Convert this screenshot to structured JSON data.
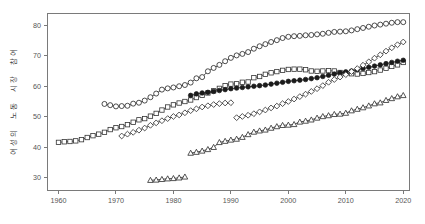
{
  "chart_data": {
    "type": "line",
    "title": "",
    "xlabel": "",
    "ylabel": "여성의 노동 시장 참여",
    "xlim": [
      1958,
      2021
    ],
    "ylim": [
      26,
      84
    ],
    "xticks": [
      1960,
      1970,
      1980,
      1990,
      2000,
      2010,
      2020
    ],
    "yticks": [
      30,
      40,
      50,
      60,
      70,
      80
    ],
    "grid": false,
    "legend": "none",
    "series": [
      {
        "name": "open-circle-series",
        "marker": "circle-open",
        "color": "#222222",
        "points": [
          [
            1968,
            54.2
          ],
          [
            1969,
            53.8
          ],
          [
            1970,
            53.4
          ],
          [
            1971,
            53.5
          ],
          [
            1972,
            53.6
          ],
          [
            1973,
            54.3
          ],
          [
            1974,
            54.6
          ],
          [
            1975,
            55.3
          ],
          [
            1976,
            56.4
          ],
          [
            1977,
            57.6
          ],
          [
            1978,
            58.9
          ],
          [
            1979,
            59.3
          ],
          [
            1980,
            59.6
          ],
          [
            1981,
            60.0
          ],
          [
            1982,
            60.4
          ],
          [
            1983,
            61.2
          ],
          [
            1984,
            62.6
          ],
          [
            1985,
            63.0
          ],
          [
            1986,
            64.9
          ],
          [
            1987,
            66.0
          ],
          [
            1988,
            67.0
          ],
          [
            1989,
            68.2
          ],
          [
            1990,
            69.3
          ],
          [
            1991,
            70.1
          ],
          [
            1992,
            70.6
          ],
          [
            1993,
            71.2
          ],
          [
            1994,
            72.3
          ],
          [
            1995,
            73.1
          ],
          [
            1996,
            73.8
          ],
          [
            1997,
            74.5
          ],
          [
            1998,
            75.1
          ],
          [
            1999,
            75.8
          ],
          [
            2000,
            76.2
          ],
          [
            2001,
            76.4
          ],
          [
            2002,
            76.5
          ],
          [
            2003,
            76.7
          ],
          [
            2004,
            76.8
          ],
          [
            2005,
            77.0
          ],
          [
            2006,
            77.2
          ],
          [
            2007,
            77.5
          ],
          [
            2008,
            77.8
          ],
          [
            2009,
            77.9
          ],
          [
            2010,
            78.0
          ],
          [
            2011,
            78.3
          ],
          [
            2012,
            78.7
          ],
          [
            2013,
            79.1
          ],
          [
            2014,
            79.5
          ],
          [
            2015,
            79.9
          ],
          [
            2016,
            80.2
          ],
          [
            2017,
            80.5
          ],
          [
            2018,
            80.8
          ],
          [
            2019,
            81.0
          ],
          [
            2020,
            81.0
          ]
        ]
      },
      {
        "name": "open-square-series",
        "marker": "square-open",
        "color": "#333333",
        "points": [
          [
            1960,
            41.6
          ],
          [
            1961,
            41.8
          ],
          [
            1962,
            41.9
          ],
          [
            1963,
            42.1
          ],
          [
            1964,
            42.5
          ],
          [
            1965,
            43.2
          ],
          [
            1966,
            43.8
          ],
          [
            1967,
            44.3
          ],
          [
            1968,
            44.9
          ],
          [
            1969,
            45.8
          ],
          [
            1970,
            46.4
          ],
          [
            1971,
            46.8
          ],
          [
            1972,
            47.4
          ],
          [
            1973,
            48.2
          ],
          [
            1974,
            49.0
          ],
          [
            1975,
            49.4
          ],
          [
            1976,
            50.2
          ],
          [
            1977,
            51.1
          ],
          [
            1978,
            52.2
          ],
          [
            1979,
            53.2
          ],
          [
            1980,
            53.9
          ],
          [
            1981,
            54.5
          ],
          [
            1982,
            55.0
          ],
          [
            1983,
            55.5
          ],
          [
            1984,
            56.3
          ],
          [
            1985,
            57.0
          ],
          [
            1986,
            57.8
          ],
          [
            1987,
            58.5
          ],
          [
            1988,
            59.3
          ],
          [
            1989,
            60.2
          ],
          [
            1990,
            60.7
          ],
          [
            1991,
            60.8
          ],
          [
            1992,
            61.3
          ],
          [
            1993,
            61.4
          ],
          [
            1994,
            62.8
          ],
          [
            1995,
            63.2
          ],
          [
            1996,
            63.9
          ],
          [
            1997,
            64.4
          ],
          [
            1998,
            64.8
          ],
          [
            1999,
            65.2
          ],
          [
            2000,
            65.5
          ],
          [
            2001,
            65.6
          ],
          [
            2002,
            65.6
          ],
          [
            2003,
            65.4
          ],
          [
            2004,
            65.0
          ],
          [
            2005,
            64.9
          ],
          [
            2006,
            65.0
          ],
          [
            2007,
            65.1
          ],
          [
            2008,
            65.0
          ],
          [
            2009,
            64.5
          ],
          [
            2010,
            64.2
          ],
          [
            2011,
            64.1
          ],
          [
            2012,
            64.0
          ],
          [
            2013,
            64.2
          ],
          [
            2014,
            64.5
          ],
          [
            2015,
            64.8
          ],
          [
            2016,
            65.3
          ],
          [
            2017,
            65.9
          ],
          [
            2018,
            66.5
          ],
          [
            2019,
            67.0
          ],
          [
            2020,
            67.8
          ]
        ]
      },
      {
        "name": "filled-circle-series",
        "marker": "circle-filled",
        "color": "#1b1b1b",
        "points": [
          [
            1983,
            57.0
          ],
          [
            1984,
            57.5
          ],
          [
            1985,
            57.8
          ],
          [
            1986,
            58.0
          ],
          [
            1987,
            58.3
          ],
          [
            1988,
            58.6
          ],
          [
            1989,
            58.9
          ],
          [
            1990,
            59.2
          ],
          [
            1991,
            59.4
          ],
          [
            1992,
            59.6
          ],
          [
            1993,
            59.8
          ],
          [
            1994,
            60.0
          ],
          [
            1995,
            60.2
          ],
          [
            1996,
            60.4
          ],
          [
            1997,
            60.7
          ],
          [
            1998,
            61.0
          ],
          [
            1999,
            61.3
          ],
          [
            2000,
            61.6
          ],
          [
            2001,
            61.8
          ],
          [
            2002,
            62.0
          ],
          [
            2003,
            62.2
          ],
          [
            2004,
            62.5
          ],
          [
            2005,
            62.8
          ],
          [
            2006,
            63.2
          ],
          [
            2007,
            63.6
          ],
          [
            2008,
            64.0
          ],
          [
            2009,
            64.4
          ],
          [
            2010,
            64.7
          ],
          [
            2011,
            65.0
          ],
          [
            2012,
            65.4
          ],
          [
            2013,
            65.8
          ],
          [
            2014,
            66.2
          ],
          [
            2015,
            66.6
          ],
          [
            2016,
            67.0
          ],
          [
            2017,
            67.4
          ],
          [
            2018,
            67.8
          ],
          [
            2019,
            68.2
          ],
          [
            2020,
            68.5
          ]
        ]
      },
      {
        "name": "open-diamond-series",
        "marker": "diamond-open",
        "color": "#2a2a2a",
        "points": [
          [
            1971,
            43.7
          ],
          [
            1972,
            44.3
          ],
          [
            1973,
            44.9
          ],
          [
            1974,
            45.6
          ],
          [
            1975,
            46.3
          ],
          [
            1976,
            47.2
          ],
          [
            1977,
            48.0
          ],
          [
            1978,
            48.7
          ],
          [
            1979,
            49.4
          ],
          [
            1980,
            50.1
          ],
          [
            1981,
            50.6
          ],
          [
            1982,
            51.3
          ],
          [
            1983,
            52.0
          ],
          [
            1984,
            52.6
          ],
          [
            1985,
            53.2
          ],
          [
            1986,
            53.6
          ],
          [
            1987,
            54.0
          ],
          [
            1988,
            54.3
          ],
          [
            1989,
            54.5
          ],
          [
            1990,
            54.6
          ],
          [
            1991,
            49.7
          ],
          [
            1992,
            50.1
          ],
          [
            1993,
            50.5
          ],
          [
            1994,
            51.0
          ],
          [
            1995,
            51.6
          ],
          [
            1996,
            52.2
          ],
          [
            1997,
            52.9
          ],
          [
            1998,
            53.5
          ],
          [
            1999,
            54.3
          ],
          [
            2000,
            55.0
          ],
          [
            2001,
            55.8
          ],
          [
            2002,
            56.6
          ],
          [
            2003,
            57.4
          ],
          [
            2004,
            58.3
          ],
          [
            2005,
            59.2
          ],
          [
            2006,
            60.2
          ],
          [
            2007,
            61.3
          ],
          [
            2008,
            62.2
          ],
          [
            2009,
            63.0
          ],
          [
            2010,
            63.8
          ],
          [
            2011,
            64.8
          ],
          [
            2012,
            65.8
          ],
          [
            2013,
            66.9
          ],
          [
            2014,
            68.0
          ],
          [
            2015,
            69.2
          ],
          [
            2016,
            70.3
          ],
          [
            2017,
            71.5
          ],
          [
            2018,
            72.6
          ],
          [
            2019,
            73.6
          ],
          [
            2020,
            74.5
          ]
        ]
      },
      {
        "name": "open-triangle-series",
        "marker": "triangle-open",
        "color": "#2a2a2a",
        "points": [
          [
            1976,
            29.2
          ],
          [
            1977,
            29.3
          ],
          [
            1978,
            29.5
          ],
          [
            1979,
            29.7
          ],
          [
            1980,
            29.8
          ],
          [
            1981,
            30.0
          ],
          [
            1982,
            30.3
          ],
          [
            1983,
            38.1
          ],
          [
            1984,
            38.4
          ],
          [
            1985,
            38.8
          ],
          [
            1986,
            39.3
          ],
          [
            1987,
            40.0
          ],
          [
            1988,
            41.6
          ],
          [
            1989,
            42.0
          ],
          [
            1990,
            42.4
          ],
          [
            1991,
            42.7
          ],
          [
            1992,
            43.3
          ],
          [
            1993,
            44.2
          ],
          [
            1994,
            45.0
          ],
          [
            1995,
            45.4
          ],
          [
            1996,
            45.7
          ],
          [
            1997,
            46.3
          ],
          [
            1998,
            46.8
          ],
          [
            1999,
            47.2
          ],
          [
            2000,
            47.3
          ],
          [
            2001,
            47.5
          ],
          [
            2002,
            48.3
          ],
          [
            2003,
            48.6
          ],
          [
            2004,
            49.0
          ],
          [
            2005,
            49.6
          ],
          [
            2006,
            50.1
          ],
          [
            2007,
            50.4
          ],
          [
            2008,
            50.8
          ],
          [
            2009,
            50.9
          ],
          [
            2010,
            51.2
          ],
          [
            2011,
            52.0
          ],
          [
            2012,
            52.5
          ],
          [
            2013,
            53.0
          ],
          [
            2014,
            53.6
          ],
          [
            2015,
            54.3
          ],
          [
            2016,
            54.6
          ],
          [
            2017,
            55.4
          ],
          [
            2018,
            56.0
          ],
          [
            2019,
            56.6
          ],
          [
            2020,
            57.0
          ]
        ]
      }
    ]
  },
  "axes": {
    "ylabel": "여성의 노동 시장 참여",
    "x_tick_labels": [
      "1960",
      "1970",
      "1980",
      "1990",
      "2000",
      "2010",
      "2020"
    ],
    "y_tick_labels": [
      "30",
      "40",
      "50",
      "60",
      "70",
      "80"
    ]
  },
  "colors": {
    "axis": "#7a7a7a",
    "tick_text": "#555555",
    "marker_stroke": "#222222",
    "background": "#ffffff"
  }
}
